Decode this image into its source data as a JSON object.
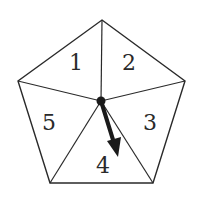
{
  "diagram": {
    "type": "spinner",
    "shape": "regular pentagon divided into 5 triangular sectors",
    "colors": {
      "stroke": "#2a2a2a",
      "background": "#ffffff",
      "arrow": "#1a1a1a"
    },
    "sectors": [
      {
        "label": "1"
      },
      {
        "label": "2"
      },
      {
        "label": "3"
      },
      {
        "label": "4"
      },
      {
        "label": "5"
      }
    ],
    "arrow": {
      "pointing_to": "4"
    }
  }
}
